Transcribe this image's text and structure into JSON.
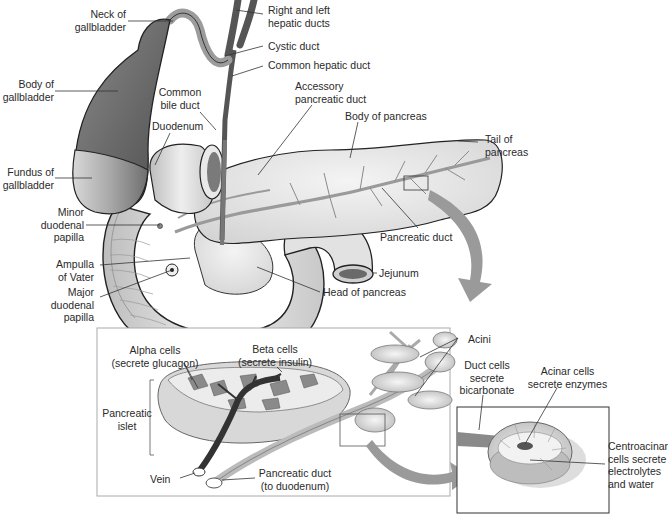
{
  "diagram": {
    "colors": {
      "ink": "#2a2a2a",
      "gallbladder_dark": "#6e6e6e",
      "organ_light": "#e6e6e6",
      "organ_mid": "#c4c4c4",
      "arrow": "#9a9a9a",
      "duct": "#8c8c8c"
    },
    "gross_anatomy_labels": {
      "neck_gallbladder": "Neck of\ngallbladder",
      "body_gallbladder": "Body of\ngallbladder",
      "fundus_gallbladder": "Fundus of\ngallbladder",
      "common_bile_duct": "Common\nbile duct",
      "duodenum": "Duodenum",
      "hepatic_ducts": "Right and left\nhepatic ducts",
      "cystic_duct": "Cystic duct",
      "common_hepatic_duct": "Common hepatic duct",
      "accessory_pancreatic_duct": "Accessory\npancreatic duct",
      "body_pancreas": "Body of pancreas",
      "tail_pancreas": "Tail of\npancreas",
      "pancreatic_duct": "Pancreatic duct",
      "minor_papilla": "Minor\nduodenal\npapilla",
      "ampulla_vater": "Ampulla\nof Vater",
      "major_papilla": "Major\nduodenal\npapilla",
      "jejunum": "Jejunum",
      "head_pancreas": "Head of pancreas"
    },
    "islet_panel_labels": {
      "alpha_cells": "Alpha cells\n(secrete glucagon)",
      "beta_cells": "Beta cells\n(secrete insulin)",
      "pancreatic_islet": "Pancreatic\nislet",
      "vein": "Vein",
      "pancreatic_duct_to_duodenum": "Pancreatic duct\n(to duodenum)",
      "acini": "Acini"
    },
    "acinus_panel_labels": {
      "duct_cells": "Duct cells\nsecrete\nbicarbonate",
      "acinar_cells": "Acinar cells\nsecrete enzymes",
      "centroacinar_cells": "Centroacinar\ncells secrete\nelectrolytes\nand water"
    }
  }
}
